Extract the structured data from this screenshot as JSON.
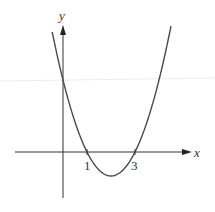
{
  "chart_data": {
    "type": "line",
    "title": "",
    "function": "y = x^2 - 4x + 3",
    "xlabel": "x",
    "ylabel": "y",
    "x_ticks": [
      "1",
      "3"
    ],
    "roots": [
      1,
      3
    ],
    "vertex": [
      2,
      -1
    ],
    "y_intercept": 3,
    "x": [
      -0.45,
      0,
      0.5,
      1,
      1.5,
      2,
      2.5,
      3,
      3.5,
      4,
      4.5
    ],
    "y": [
      5.0,
      3,
      1.25,
      0,
      -0.75,
      -1,
      -0.75,
      0,
      1.25,
      3,
      5.0
    ],
    "grid": false,
    "legend": null
  },
  "colors": {
    "axis": "#333333",
    "curve": "#4a4a4a",
    "background": "#ffffff",
    "faint_line": "#e8e8e8"
  }
}
